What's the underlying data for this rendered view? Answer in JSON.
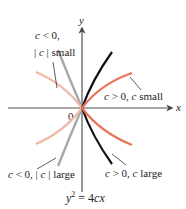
{
  "figure": {
    "equation": {
      "y": "y",
      "exp": "2",
      "rest": " = 4",
      "c": "c",
      "x": "x"
    },
    "axes": {
      "x_label": "x",
      "y_label": "y",
      "origin_label": "0"
    },
    "labels": {
      "neg_small_line1_c": "c",
      "neg_small_line1_rest": " < 0,",
      "neg_small_line2_bar1": "| ",
      "neg_small_line2_c": "c",
      "neg_small_line2_rest": " | small",
      "pos_small_c1": "c",
      "pos_small_mid": " > 0, ",
      "pos_small_c2": "c",
      "pos_small_rest": " small",
      "neg_large_c1": "c",
      "neg_large_mid": " < 0, | ",
      "neg_large_c2": "c",
      "neg_large_rest": " | large",
      "pos_large_c1": "c",
      "pos_large_mid": " > 0, ",
      "pos_large_c2": "c",
      "pos_large_rest": " large"
    },
    "colors": {
      "axis": "#555555",
      "pos_large": "#111111",
      "pos_small": "#e8735a",
      "neg_small": "#f0b8a8",
      "neg_large": "#a8a8a8",
      "leader": "#333333"
    }
  }
}
